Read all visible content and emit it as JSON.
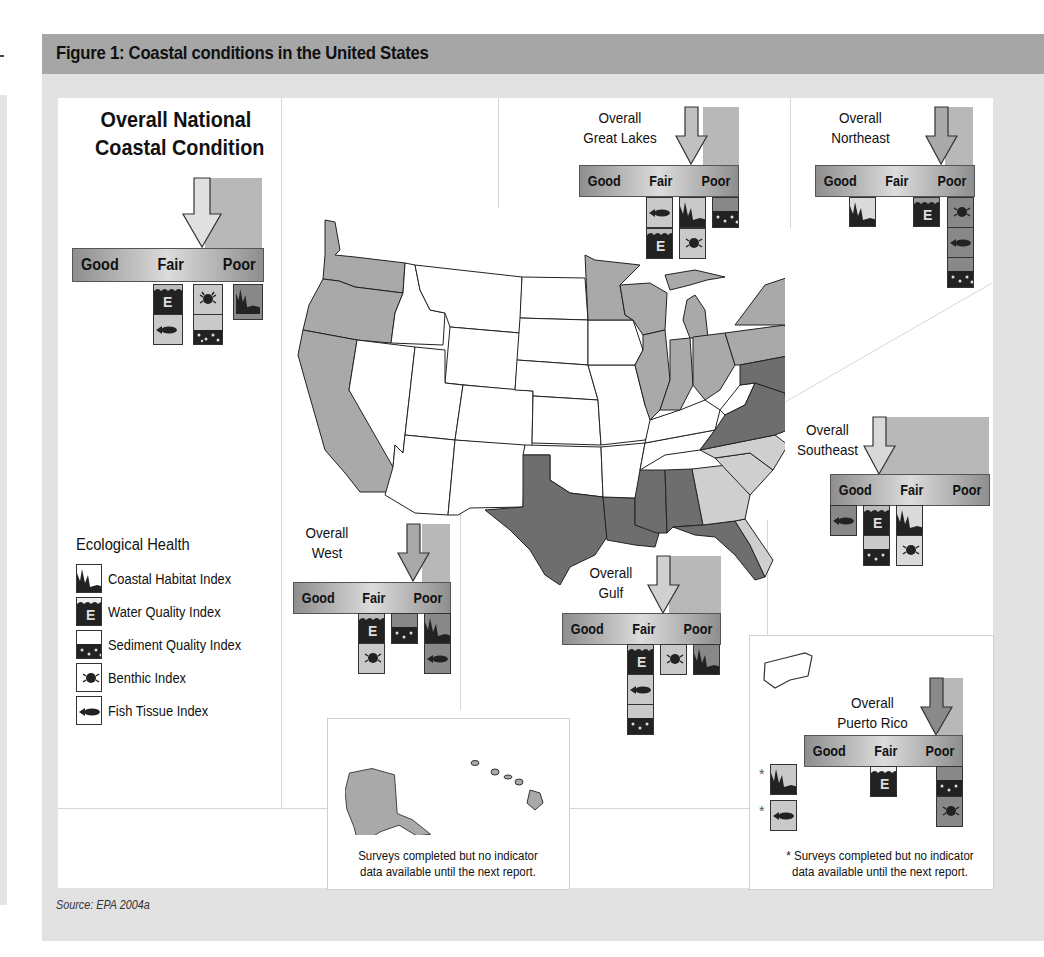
{
  "figure": {
    "title": "Figure 1: Coastal conditions in the United States",
    "source": "Source: EPA 2004a"
  },
  "scale_labels": {
    "good": "Good",
    "fair": "Fair",
    "poor": "Poor"
  },
  "regions": {
    "national": {
      "title_line1": "Overall National",
      "title_line2": "Coastal Condition",
      "overall": "Fair-Poor",
      "good": [],
      "fair": [
        "Water Quality Index",
        "Fish Tissue Index"
      ],
      "fair_poor": [
        "Benthic Index",
        "Sediment Quality Index"
      ],
      "poor": [
        "Coastal Habitat Index"
      ]
    },
    "great_lakes": {
      "title_line1": "Overall",
      "title_line2": "Great Lakes",
      "overall": "Fair-Poor",
      "fair": [
        "Fish Tissue Index",
        "Water Quality Index"
      ],
      "fair_poor": [
        "Coastal Habitat Index",
        "Benthic Index"
      ],
      "poor": [
        "Sediment Quality Index"
      ]
    },
    "northeast": {
      "title_line1": "Overall",
      "title_line2": "Northeast",
      "overall": "Poor",
      "good_fair": [
        "Coastal Habitat Index"
      ],
      "fair_poor": [
        "Water Quality Index"
      ],
      "poor": [
        "Benthic Index",
        "Fish Tissue Index",
        "Sediment Quality Index"
      ]
    },
    "southeast": {
      "title_line1": "Overall",
      "title_line2": "Southeast",
      "overall": "Good-Fair",
      "good": [
        "Fish Tissue Index"
      ],
      "good_fair": [
        "Water Quality Index",
        "Sediment Quality Index"
      ],
      "fair": [
        "Coastal Habitat Index",
        "Benthic Index"
      ]
    },
    "west": {
      "title_line1": "Overall",
      "title_line2": "West",
      "overall": "Fair-Poor",
      "fair": [
        "Water Quality Index",
        "Benthic Index"
      ],
      "fair_poor": [
        "Sediment Quality Index"
      ],
      "poor": [
        "Coastal Habitat Index",
        "Fish Tissue Index"
      ]
    },
    "gulf": {
      "title_line1": "Overall",
      "title_line2": "Gulf",
      "overall": "Fair",
      "fair": [
        "Water Quality Index",
        "Fish Tissue Index",
        "Sediment Quality Index"
      ],
      "fair_poor": [
        "Benthic Index"
      ],
      "poor": [
        "Coastal Habitat Index"
      ]
    },
    "puerto_rico": {
      "title_line1": "Overall",
      "title_line2": "Puerto Rico",
      "overall": "Poor",
      "fair": [
        "Water Quality Index"
      ],
      "poor": [
        "Sediment Quality Index",
        "Benthic Index"
      ],
      "no_data": [
        "Coastal Habitat Index",
        "Fish Tissue Index"
      ]
    }
  },
  "legend": {
    "title": "Ecological Health",
    "items": [
      {
        "icon": "coastal-habitat-icon",
        "label": "Coastal Habitat Index"
      },
      {
        "icon": "water-quality-icon",
        "label": "Water Quality Index"
      },
      {
        "icon": "sediment-quality-icon",
        "label": "Sediment Quality Index"
      },
      {
        "icon": "benthic-icon",
        "label": "Benthic Index"
      },
      {
        "icon": "fish-tissue-icon",
        "label": "Fish Tissue Index"
      }
    ]
  },
  "notes": {
    "alaska_hawaii_line1": "Surveys completed but no indicator",
    "alaska_hawaii_line2": "data available until the next report.",
    "pr_star": "*",
    "pr_line1": "* Surveys completed but no indicator",
    "pr_line2": "data available until the next report."
  },
  "colors": {
    "title_band": "#a6a6a6",
    "frame": "#e2e2e2",
    "good": "#cfcfcf",
    "fair": "#a9a9a9",
    "poor": "#6e6e6e",
    "not_assessed": "#ffffff"
  }
}
